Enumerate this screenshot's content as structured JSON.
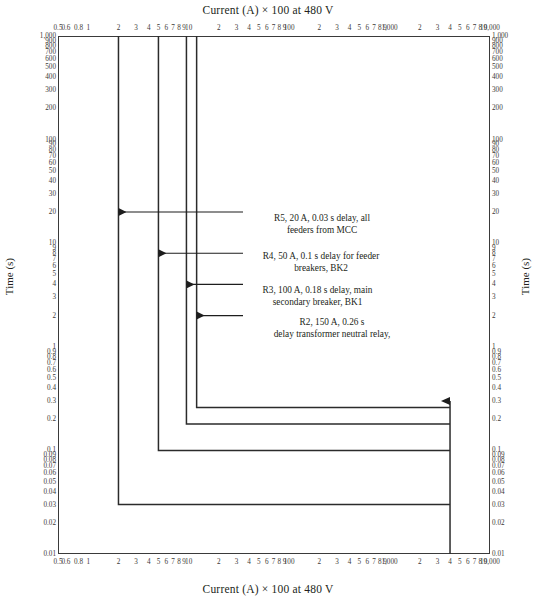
{
  "chart_data": {
    "type": "line",
    "title": "Current (A) × 100 at 480 V",
    "xlabel": "Current (A) × 100 at 480 V",
    "ylabel": "Time (s)",
    "xscale": "log",
    "yscale": "log",
    "xlim": [
      0.5,
      10000
    ],
    "ylim": [
      0.01,
      1000
    ],
    "grid": false,
    "legend": "none",
    "xticks": [
      {
        "v": 0.5,
        "label": "0.5"
      },
      {
        "v": 0.6,
        "label": "0.6"
      },
      {
        "v": 0.8,
        "label": "0.8"
      },
      {
        "v": 1,
        "label": "1"
      },
      {
        "v": 2,
        "label": "2"
      },
      {
        "v": 3,
        "label": "3"
      },
      {
        "v": 4,
        "label": "4"
      },
      {
        "v": 5,
        "label": "5"
      },
      {
        "v": 6,
        "label": "6"
      },
      {
        "v": 7,
        "label": "7"
      },
      {
        "v": 8,
        "label": "8"
      },
      {
        "v": 9,
        "label": "9"
      },
      {
        "v": 10,
        "label": "10"
      },
      {
        "v": 20,
        "label": "2"
      },
      {
        "v": 30,
        "label": "3"
      },
      {
        "v": 40,
        "label": "4"
      },
      {
        "v": 50,
        "label": "5"
      },
      {
        "v": 60,
        "label": "6"
      },
      {
        "v": 70,
        "label": "7"
      },
      {
        "v": 80,
        "label": "8"
      },
      {
        "v": 90,
        "label": "9"
      },
      {
        "v": 100,
        "label": "100"
      },
      {
        "v": 200,
        "label": "2"
      },
      {
        "v": 300,
        "label": "3"
      },
      {
        "v": 400,
        "label": "4"
      },
      {
        "v": 500,
        "label": "5"
      },
      {
        "v": 600,
        "label": "6"
      },
      {
        "v": 700,
        "label": "7"
      },
      {
        "v": 800,
        "label": "8"
      },
      {
        "v": 900,
        "label": "9"
      },
      {
        "v": 1000,
        "label": "1,000"
      },
      {
        "v": 2000,
        "label": "2"
      },
      {
        "v": 3000,
        "label": "3"
      },
      {
        "v": 4000,
        "label": "4"
      },
      {
        "v": 5000,
        "label": "5"
      },
      {
        "v": 6000,
        "label": "6"
      },
      {
        "v": 7000,
        "label": "7"
      },
      {
        "v": 8000,
        "label": "8"
      },
      {
        "v": 9000,
        "label": "9"
      },
      {
        "v": 10000,
        "label": "10,000"
      }
    ],
    "yticks": [
      {
        "v": 1000,
        "label": "1,000"
      },
      {
        "v": 900,
        "label": "900"
      },
      {
        "v": 800,
        "label": "800"
      },
      {
        "v": 700,
        "label": "700"
      },
      {
        "v": 600,
        "label": "600"
      },
      {
        "v": 500,
        "label": "500"
      },
      {
        "v": 400,
        "label": "400"
      },
      {
        "v": 300,
        "label": "300"
      },
      {
        "v": 200,
        "label": "200"
      },
      {
        "v": 100,
        "label": "100"
      },
      {
        "v": 90,
        "label": "90"
      },
      {
        "v": 80,
        "label": "80"
      },
      {
        "v": 70,
        "label": "70"
      },
      {
        "v": 60,
        "label": "60"
      },
      {
        "v": 50,
        "label": "50"
      },
      {
        "v": 40,
        "label": "40"
      },
      {
        "v": 30,
        "label": "30"
      },
      {
        "v": 20,
        "label": "20"
      },
      {
        "v": 10,
        "label": "10"
      },
      {
        "v": 9,
        "label": "9"
      },
      {
        "v": 8,
        "label": "8"
      },
      {
        "v": 7,
        "label": "7"
      },
      {
        "v": 6,
        "label": "6"
      },
      {
        "v": 5,
        "label": "5"
      },
      {
        "v": 4,
        "label": "4"
      },
      {
        "v": 3,
        "label": "3"
      },
      {
        "v": 2,
        "label": "2"
      },
      {
        "v": 1,
        "label": "1"
      },
      {
        "v": 0.9,
        "label": "0.9"
      },
      {
        "v": 0.8,
        "label": "0.8"
      },
      {
        "v": 0.7,
        "label": "0.7"
      },
      {
        "v": 0.6,
        "label": "0.6"
      },
      {
        "v": 0.5,
        "label": "0.5"
      },
      {
        "v": 0.4,
        "label": "0.4"
      },
      {
        "v": 0.3,
        "label": "0.3"
      },
      {
        "v": 0.2,
        "label": "0.2"
      },
      {
        "v": 0.1,
        "label": "0.1"
      },
      {
        "v": 0.09,
        "label": "0.09"
      },
      {
        "v": 0.08,
        "label": "0.08"
      },
      {
        "v": 0.07,
        "label": "0.07"
      },
      {
        "v": 0.06,
        "label": "0.06"
      },
      {
        "v": 0.05,
        "label": "0.05"
      },
      {
        "v": 0.04,
        "label": "0.04"
      },
      {
        "v": 0.03,
        "label": "0.03"
      },
      {
        "v": 0.02,
        "label": "0.02"
      },
      {
        "v": 0.01,
        "label": "0.01"
      }
    ],
    "series": [
      {
        "name": "R5",
        "device": "R5, 20 A, 0.03 s delay, all feeders from MCC",
        "pickup_current": 2,
        "delay_s": 0.03,
        "points": [
          [
            2,
            1000
          ],
          [
            2,
            0.03
          ],
          [
            4000,
            0.03
          ]
        ]
      },
      {
        "name": "R4",
        "device": "R4, 50 A, 0.1 s delay for feeder breakers, BK2",
        "pickup_current": 5,
        "delay_s": 0.1,
        "points": [
          [
            5,
            1000
          ],
          [
            5,
            0.1
          ],
          [
            4000,
            0.1
          ]
        ]
      },
      {
        "name": "R3",
        "device": "R3, 100 A, 0.18 s delay, main secondary breaker, BK1",
        "pickup_current": 9.5,
        "delay_s": 0.18,
        "points": [
          [
            9.5,
            1000
          ],
          [
            9.5,
            0.18
          ],
          [
            4000,
            0.18
          ]
        ]
      },
      {
        "name": "R2",
        "device": "R2, 150 A, 0.26 s delay transformer neutral relay,",
        "pickup_current": 12,
        "delay_s": 0.26,
        "points": [
          [
            12,
            1000
          ],
          [
            12,
            0.26
          ],
          [
            4000,
            0.26
          ]
        ]
      }
    ],
    "fault_marker": {
      "name": "fault-current-arrow",
      "current": 4000,
      "time_top": 0.3
    },
    "annotations": [
      {
        "id": "r5",
        "text": "R5, 20 A, 0.03 s delay, all\nfeeders from MCC",
        "arrow_to_current": 2,
        "arrow_time": 20
      },
      {
        "id": "r4",
        "text": "R4, 50 A, 0.1 s delay for feeder\nbreakers, BK2",
        "arrow_to_current": 5,
        "arrow_time": 8
      },
      {
        "id": "r3",
        "text": "R3, 100 A, 0.18 s delay, main\nsecondary breaker, BK1",
        "arrow_to_current": 9.5,
        "arrow_time": 4
      },
      {
        "id": "r2",
        "text": "R2, 150 A, 0.26 s\ndelay transformer neutral relay,",
        "arrow_to_current": 12,
        "arrow_time": 2
      }
    ],
    "colors": {
      "axis": "#3a3a3a",
      "curve": "#2b2b2b",
      "text": "#231f20",
      "background": "#ffffff"
    }
  }
}
